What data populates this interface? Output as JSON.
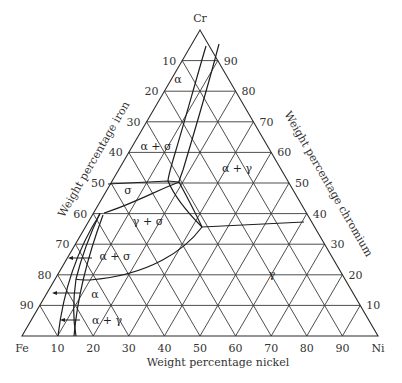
{
  "diagram": {
    "type": "ternary-phase-diagram",
    "corners": {
      "top": "Cr",
      "left": "Fe",
      "right": "Ni"
    },
    "axes": {
      "left": "Weight percentage iron",
      "right": "Weight percentage chromium",
      "bottom": "Weight percentage nickel"
    },
    "ticks": {
      "left": [
        "10",
        "20",
        "30",
        "40",
        "50",
        "60",
        "70",
        "80",
        "90"
      ],
      "right": [
        "90",
        "80",
        "70",
        "60",
        "50",
        "40",
        "30",
        "20",
        "10"
      ],
      "bottom": [
        "10",
        "20",
        "30",
        "40",
        "50",
        "60",
        "70",
        "80",
        "90"
      ]
    },
    "regions": [
      {
        "id": "alpha-top",
        "label": "α"
      },
      {
        "id": "alpha-sigma-top",
        "label": "α + σ"
      },
      {
        "id": "alpha-gamma-top",
        "label": "α + γ"
      },
      {
        "id": "sigma",
        "label": "σ"
      },
      {
        "id": "gamma-sigma",
        "label": "γ + σ"
      },
      {
        "id": "alpha-sigma-bottom",
        "label": "α + σ"
      },
      {
        "id": "gamma",
        "label": "γ"
      },
      {
        "id": "alpha-bottom",
        "label": "α"
      },
      {
        "id": "alpha-gamma-bottom",
        "label": "α + γ"
      }
    ]
  }
}
